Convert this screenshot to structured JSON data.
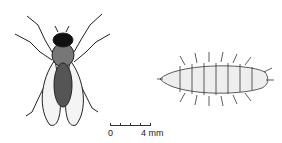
{
  "figure": {
    "subjects": [
      {
        "name": "adult-fly",
        "view": "dorsal"
      },
      {
        "name": "larva",
        "view": "dorsal"
      }
    ],
    "scale_bar": {
      "start_label": "0",
      "end_label": "4 mm"
    }
  }
}
